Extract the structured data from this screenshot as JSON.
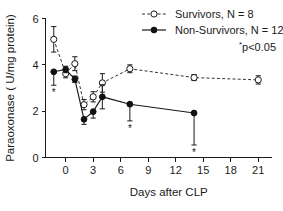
{
  "chart_data": {
    "type": "line",
    "title": "",
    "xlabel": "Days after CLP",
    "ylabel": "Paraoxonase  ( U/mg protein)",
    "xlim": [
      -2.2,
      22.5
    ],
    "ylim": [
      0,
      6
    ],
    "xticks": [
      0,
      3,
      6,
      9,
      12,
      15,
      18,
      21
    ],
    "yticks": [
      0,
      2,
      4,
      6
    ],
    "grid": false,
    "legend_position": "top-right",
    "annotation": "p<0.05",
    "annotation_star": "*",
    "series": [
      {
        "name": "Survivors, N = 8",
        "marker": "open-circle",
        "line": "dashed",
        "x": [
          -1.3,
          0.0,
          1.0,
          2.0,
          3.0,
          4.0,
          7.0,
          14.0,
          21.0
        ],
        "values": [
          5.1,
          3.62,
          4.05,
          2.28,
          2.62,
          3.22,
          3.83,
          3.45,
          3.35
        ],
        "err_up": [
          0.55,
          0.18,
          0.3,
          0.22,
          0.22,
          0.4,
          0.17,
          0.13,
          0.18
        ],
        "err_down": [
          0.55,
          0.18,
          0.3,
          0.22,
          0.22,
          0.4,
          0.17,
          0.13,
          0.18
        ],
        "significant": [
          false,
          false,
          false,
          false,
          false,
          false,
          false,
          false,
          false
        ]
      },
      {
        "name": "Non-Survivors, N = 12",
        "marker": "filled-circle",
        "line": "solid",
        "x": [
          -1.3,
          0.0,
          1.0,
          2.0,
          3.0,
          4.0,
          7.0,
          14.0
        ],
        "values": [
          3.7,
          3.8,
          3.38,
          1.65,
          1.98,
          2.62,
          2.3,
          1.92
        ],
        "err_up": [
          0.0,
          0.14,
          0.14,
          0.0,
          0.0,
          0.52,
          0.0,
          0.0
        ],
        "err_down": [
          0.58,
          0.14,
          0.14,
          0.22,
          0.28,
          0.52,
          0.72,
          1.38
        ],
        "significant": [
          true,
          false,
          false,
          false,
          false,
          false,
          true,
          true
        ]
      }
    ]
  },
  "legend": {
    "items": [
      {
        "label": "Survivors, N = 8"
      },
      {
        "label": "Non-Survivors, N = 12"
      }
    ]
  }
}
